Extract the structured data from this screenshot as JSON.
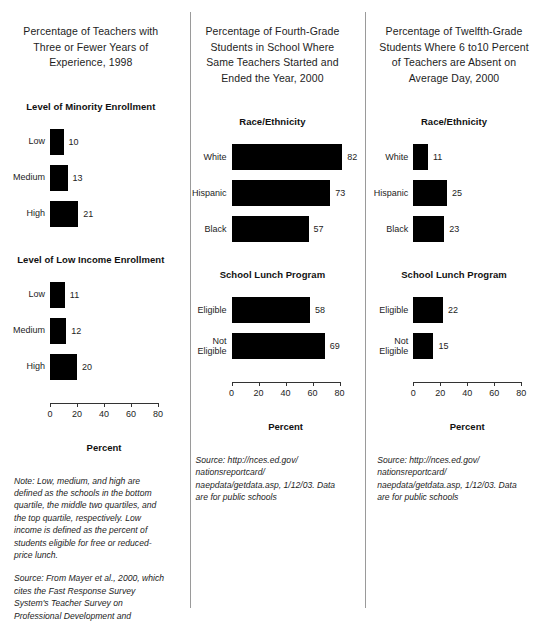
{
  "chart_data": [
    {
      "type": "bar",
      "title": "Percentage of Teachers with Three or Fewer Years of Experience, 1998",
      "xlabel": "Percent",
      "ylabel": "",
      "xlim": [
        0,
        80
      ],
      "ticks": [
        0,
        20,
        40,
        60,
        80
      ],
      "orientation": "horizontal",
      "grid": false,
      "legend": "none",
      "groups": [
        {
          "name": "Level of Minority Enrollment",
          "categories": [
            "Low",
            "Medium",
            "High"
          ],
          "values": [
            10,
            13,
            21
          ]
        },
        {
          "name": "Level of Low Income Enrollment",
          "categories": [
            "Low",
            "Medium",
            "High"
          ],
          "values": [
            11,
            12,
            20
          ]
        }
      ],
      "notes": [
        "Note: Low, medium, and high are defined as the schools in the bottom quartile, the middle two quartiles, and the top quartile, respectively. Low income is defined as the percent of students eligible for free or reduced-price lunch.",
        "Source: From Mayer et al., 2000, which cites the Fast Response Survey System's Teacher Survey on Professional Development and Training, NCES, 1998."
      ]
    },
    {
      "type": "bar",
      "title": "Percentage of Fourth-Grade Students in School Where Same Teachers Started and Ended the Year, 2000",
      "xlabel": "Percent",
      "ylabel": "",
      "xlim": [
        0,
        80
      ],
      "ticks": [
        0,
        20,
        40,
        60,
        80
      ],
      "orientation": "horizontal",
      "grid": false,
      "legend": "none",
      "groups": [
        {
          "name": "Race/Ethnicity",
          "categories": [
            "White",
            "Hispanic",
            "Black"
          ],
          "values": [
            82,
            73,
            57
          ]
        },
        {
          "name": "School Lunch Program",
          "categories": [
            "Eligible",
            "Not\nEligible"
          ],
          "values": [
            58,
            69
          ]
        }
      ],
      "notes": [
        "Source: http://nces.ed.gov/ nationsreportcard/ naepdata/getdata.asp, 1/12/03. Data are for public schools"
      ]
    },
    {
      "type": "bar",
      "title": "Percentage of Twelfth-Grade Students Where 6 to10 Percent of Teachers are Absent on Average Day, 2000",
      "xlabel": "Percent",
      "ylabel": "",
      "xlim": [
        0,
        80
      ],
      "ticks": [
        0,
        20,
        40,
        60,
        80
      ],
      "orientation": "horizontal",
      "grid": false,
      "legend": "none",
      "groups": [
        {
          "name": "Race/Ethnicity",
          "categories": [
            "White",
            "Hispanic",
            "Black"
          ],
          "values": [
            11,
            25,
            23
          ]
        },
        {
          "name": "School Lunch Program",
          "categories": [
            "Eligible",
            "Not\nEligible"
          ],
          "values": [
            22,
            15
          ]
        }
      ],
      "notes": [
        "Source: http://nces.ed.gov/ nationsreportcard/ naepdata/getdata.asp, 1/12/03. Data are for public schools"
      ]
    }
  ],
  "panels": [
    {
      "title": "Percentage of Teachers with Three or Fewer Years of Experience, 1998",
      "groups": [
        {
          "title": "Level of Minority Enrollment",
          "rows": [
            {
              "label": "Low",
              "value": "10"
            },
            {
              "label": "Medium",
              "value": "13"
            },
            {
              "label": "High",
              "value": "21"
            }
          ]
        },
        {
          "title": "Level of Low Income Enrollment",
          "rows": [
            {
              "label": "Low",
              "value": "11"
            },
            {
              "label": "Medium",
              "value": "12"
            },
            {
              "label": "High",
              "value": "20"
            }
          ]
        }
      ],
      "axis": {
        "caption": "Percent",
        "ticks": [
          "0",
          "20",
          "40",
          "60",
          "80"
        ]
      },
      "notes": [
        {
          "lead": "Note:",
          "segments": [
            {
              "text": " Low, medium, and high are defined as the schools in the bottom quartile, the middle two quartiles, and the top quartile, respectively. Low income is defined as the percent of students eligible for free or reduced-price lunch.",
              "italic": true
            }
          ]
        },
        {
          "lead": "Source:",
          "segments": [
            {
              "text": " From Mayer et al., 2000, which cites the Fast Response Survey System's Teacher Survey on Professional Development and Training, NCES, 1998.",
              "italic": true
            }
          ]
        }
      ]
    },
    {
      "title": "Percentage of Fourth-Grade Students in School Where Same Teachers Started and Ended the Year, 2000",
      "groups": [
        {
          "title": "Race/Ethnicity",
          "rows": [
            {
              "label": "White",
              "value": "82"
            },
            {
              "label": "Hispanic",
              "value": "73"
            },
            {
              "label": "Black",
              "value": "57"
            }
          ]
        },
        {
          "title": "School Lunch Program",
          "rows": [
            {
              "label": "Eligible",
              "value": "58"
            },
            {
              "label": "Not\nEligible",
              "value": "69"
            }
          ]
        }
      ],
      "axis": {
        "caption": "Percent",
        "ticks": [
          "0",
          "20",
          "40",
          "60",
          "80"
        ]
      },
      "notes": [
        {
          "lead": "Source:",
          "segments": [
            {
              "text": " http://nces.ed.gov/ nationsreportcard/ naepdata/getdata.asp, 1/12/03. Data are for public schools",
              "italic": true
            }
          ]
        }
      ]
    },
    {
      "title": "Percentage of Twelfth-Grade Students Where 6 to10 Percent of Teachers are Absent on Average Day, 2000",
      "groups": [
        {
          "title": "Race/Ethnicity",
          "rows": [
            {
              "label": "White",
              "value": "11"
            },
            {
              "label": "Hispanic",
              "value": "25"
            },
            {
              "label": "Black",
              "value": "23"
            }
          ]
        },
        {
          "title": "School Lunch Program",
          "rows": [
            {
              "label": "Eligible",
              "value": "22"
            },
            {
              "label": "Not\nEligible",
              "value": "15"
            }
          ]
        }
      ],
      "axis": {
        "caption": "Percent",
        "ticks": [
          "0",
          "20",
          "40",
          "60",
          "80"
        ]
      },
      "notes": [
        {
          "lead": "Source:",
          "segments": [
            {
              "text": " http://nces.ed.gov/ nationsreportcard/ naepdata/getdata.asp, 1/12/03. Data are for public schools",
              "italic": true
            }
          ]
        }
      ]
    }
  ],
  "style": {
    "bar_color": "#000000",
    "divider_color": "#9a9a9a",
    "text_color": "#1d1d1d"
  }
}
